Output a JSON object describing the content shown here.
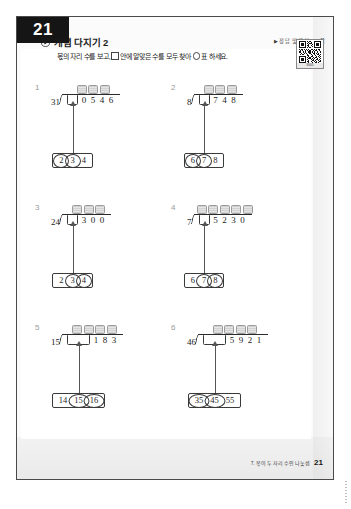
{
  "page": {
    "badge_number": "21",
    "answer_reference": "정답 및 해설 4~5쪽",
    "answer_reference_marker": "▶",
    "footer_chapter": "7. 몫이 두 자리 수인 나눗셈",
    "footer_page": "21"
  },
  "header": {
    "section_icon": "play-circle-icon",
    "section_title": "개념 다지기 2",
    "instruction_part1": "몫의 자리 수를 보고,",
    "instruction_part2": "안에 알맞은 수를 모두 찾아",
    "instruction_part3": "표 하세요."
  },
  "qr": {
    "label": "3605"
  },
  "problems": [
    {
      "number": "1",
      "divisor": "31",
      "blank_width": "single",
      "shade_count": 3,
      "dividend_digits": [
        "0",
        "5",
        "4",
        "6"
      ],
      "choices": [
        {
          "value": "2",
          "circled": true
        },
        {
          "value": "3",
          "circled": true
        },
        {
          "value": "4",
          "circled": false
        }
      ]
    },
    {
      "number": "2",
      "divisor": "8",
      "blank_width": "single",
      "shade_count": 3,
      "dividend_digits": [
        "7",
        "4",
        "8"
      ],
      "choices": [
        {
          "value": "6",
          "circled": true
        },
        {
          "value": "7",
          "circled": true
        },
        {
          "value": "8",
          "circled": false
        }
      ]
    },
    {
      "number": "3",
      "divisor": "24",
      "blank_width": "single",
      "shade_count": 3,
      "dividend_digits": [
        "3",
        "0",
        "0"
      ],
      "choices": [
        {
          "value": "2",
          "circled": false
        },
        {
          "value": "3",
          "circled": true
        },
        {
          "value": "4",
          "circled": true
        }
      ]
    },
    {
      "number": "4",
      "divisor": "7",
      "blank_width": "single",
      "shade_count": 5,
      "dividend_digits": [
        "5",
        "2",
        "3",
        "0"
      ],
      "choices": [
        {
          "value": "6",
          "circled": false
        },
        {
          "value": "7",
          "circled": true
        },
        {
          "value": "8",
          "circled": true
        }
      ]
    },
    {
      "number": "5",
      "divisor": "15",
      "blank_width": "wide",
      "shade_count": 4,
      "dividend_digits": [
        "1",
        "8",
        "3"
      ],
      "choices": [
        {
          "value": "14",
          "circled": false
        },
        {
          "value": "15",
          "circled": true
        },
        {
          "value": "16",
          "circled": true
        }
      ]
    },
    {
      "number": "6",
      "divisor": "46",
      "blank_width": "wide",
      "shade_count": 4,
      "dividend_digits": [
        "5",
        "9",
        "2",
        "1"
      ],
      "choices": [
        {
          "value": "35",
          "circled": true
        },
        {
          "value": "45",
          "circled": true
        },
        {
          "value": "55",
          "circled": false
        }
      ]
    }
  ],
  "colors": {
    "badge_bg": "#151515",
    "ink": "#1d1d1d",
    "rule": "#3a3a3a",
    "shade": "#dcdcdc",
    "muted": "#9a9a9a"
  }
}
